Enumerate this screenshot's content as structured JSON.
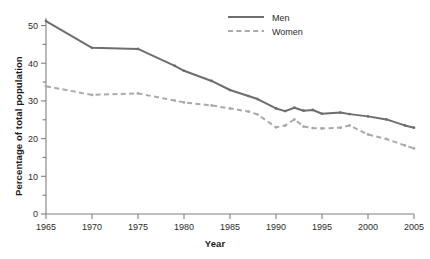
{
  "chart_data": {
    "type": "line",
    "title": "",
    "xlabel": "Year",
    "ylabel": "Percentage of total population",
    "xlim": [
      1965,
      2005
    ],
    "ylim": [
      0,
      52
    ],
    "grid": false,
    "legend_position": "top-center",
    "xticks": [
      1965,
      1970,
      1975,
      1980,
      1985,
      1990,
      1995,
      2000,
      2005
    ],
    "xtick_labels": [
      "1965",
      "1970",
      "1975",
      "1980",
      "1985",
      "1990",
      "1995",
      "2000",
      "2005"
    ],
    "yticks": [
      0,
      10,
      20,
      30,
      40,
      50
    ],
    "ytick_labels": [
      "0",
      "10",
      "20",
      "30",
      "40",
      "50"
    ],
    "yminor_ticks": [
      5,
      15,
      25,
      35,
      45
    ],
    "series": [
      {
        "name": "Men",
        "style": "solid",
        "color": "#6e6e6e",
        "x": [
          1965,
          1970,
          1975,
          1979,
          1980,
          1983,
          1985,
          1987,
          1988,
          1990,
          1991,
          1992,
          1993,
          1994,
          1995,
          1997,
          1998,
          2000,
          2002,
          2004,
          2005
        ],
        "values": [
          51.2,
          44.1,
          43.8,
          39.3,
          38.0,
          35.3,
          32.9,
          31.3,
          30.5,
          28.0,
          27.3,
          28.2,
          27.4,
          27.6,
          26.6,
          26.9,
          26.5,
          25.9,
          25.1,
          23.5,
          22.9
        ]
      },
      {
        "name": "Women",
        "style": "dashed",
        "color": "#aaaaaa",
        "x": [
          1965,
          1970,
          1975,
          1979,
          1980,
          1983,
          1985,
          1987,
          1988,
          1990,
          1991,
          1992,
          1993,
          1994,
          1995,
          1997,
          1998,
          2000,
          2002,
          2004,
          2005
        ],
        "values": [
          33.9,
          31.6,
          32.0,
          30.1,
          29.6,
          28.8,
          28.0,
          27.2,
          26.4,
          23.0,
          23.5,
          25.1,
          23.2,
          22.8,
          22.7,
          22.9,
          23.5,
          21.1,
          19.9,
          18.2,
          17.4
        ]
      }
    ],
    "legend": [
      {
        "label": "Men",
        "style": "solid",
        "color": "#6e6e6e"
      },
      {
        "label": "Women",
        "style": "dashed",
        "color": "#aaaaaa"
      }
    ]
  },
  "axes": {
    "x_title": "Year",
    "y_title": "Percentage of total population"
  }
}
